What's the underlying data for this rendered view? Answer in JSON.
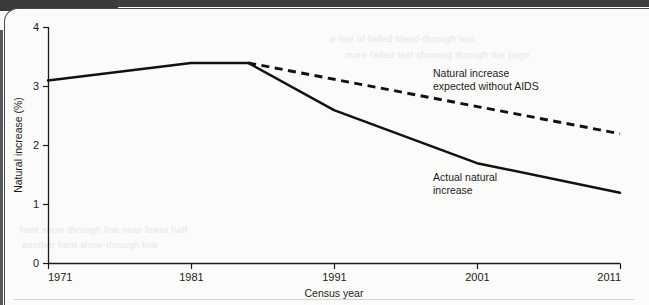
{
  "page": {
    "background_color": "#fbfbfa",
    "scan_bar_color": "#3a3a3c",
    "ghost_text": [
      "a line of faded bleed-through text",
      "more faded text showing through the page",
      "faint show-through line near lower half",
      "another faint show-through line"
    ]
  },
  "chart_data": {
    "type": "line",
    "title": "",
    "xlabel": "Census year",
    "ylabel": "Natural increase (%)",
    "x": [
      1971,
      1981,
      1985,
      1991,
      2001,
      2011
    ],
    "xlim": [
      1971,
      2011
    ],
    "ylim": [
      0,
      4
    ],
    "xticks": [
      "1971",
      "1981",
      "1991",
      "2001",
      "2011"
    ],
    "xtick_values": [
      1971,
      1981,
      1991,
      2001,
      2011
    ],
    "yticks": [
      "0",
      "1",
      "2",
      "3",
      "4"
    ],
    "ytick_values": [
      0,
      1,
      2,
      3,
      4
    ],
    "grid": false,
    "legend_position": "inline-annotation",
    "series": [
      {
        "name": "Actual natural increase",
        "style": "solid",
        "color": "#121212",
        "x": [
          1971,
          1981,
          1985,
          1991,
          2001,
          2011
        ],
        "values": [
          3.1,
          3.4,
          3.4,
          2.6,
          1.7,
          1.2
        ]
      },
      {
        "name": "Natural increase expected without AIDS",
        "style": "dashed",
        "color": "#121212",
        "x": [
          1985,
          2011
        ],
        "values": [
          3.4,
          2.2
        ]
      }
    ],
    "annotations": [
      {
        "id": "expected-label",
        "lines": [
          "Natural increase",
          "expected without AIDS"
        ],
        "x": 1991.5,
        "y": 2.95
      },
      {
        "id": "actual-label",
        "lines": [
          "Actual natural",
          "increase"
        ],
        "x": 1997.0,
        "y": 1.55
      }
    ]
  }
}
